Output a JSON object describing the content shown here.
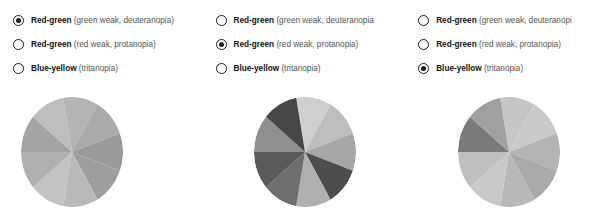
{
  "panels": [
    {
      "id": "deuteranopia-panel",
      "options": [
        {
          "name": "Red-green",
          "detail": "(green weak, deuteranopia)",
          "selected": true
        },
        {
          "name": "Red-green",
          "detail": "(red weak, protanopia)",
          "selected": false
        },
        {
          "name": "Blue-yellow",
          "detail": "(tritanopia)",
          "selected": false
        }
      ],
      "chart_name": "pie-chart-deuteranopia"
    },
    {
      "id": "protanopia-panel",
      "options": [
        {
          "name": "Red-green",
          "detail": "(green weak, deuteranopia",
          "selected": false
        },
        {
          "name": "Red-green",
          "detail": "(red weak, protanopia)",
          "selected": true
        },
        {
          "name": "Blue-yellow",
          "detail": "(tritanopia)",
          "selected": false
        }
      ],
      "chart_name": "pie-chart-protanopia"
    },
    {
      "id": "tritanopia-panel",
      "options": [
        {
          "name": "Red-green",
          "detail": "(green weak, deuteranopi",
          "selected": false
        },
        {
          "name": "Red-green",
          "detail": "(red weak, protanopia)",
          "selected": false
        },
        {
          "name": "Blue-yellow",
          "detail": "(tritanopia)",
          "selected": true
        }
      ],
      "chart_name": "pie-chart-tritanopia"
    }
  ],
  "chart_data": [
    {
      "type": "pie",
      "title": "Red-green (green weak, deuteranopia)",
      "categories": [
        "1",
        "2",
        "3",
        "4",
        "5",
        "6",
        "7",
        "8",
        "9"
      ],
      "values": [
        40,
        40,
        40,
        40,
        40,
        40,
        40,
        40,
        40
      ],
      "start_angle": -100,
      "colors": [
        "#b4b4b4",
        "#a9a9a9",
        "#9a9a9a",
        "#9e9e9e",
        "#b9b9b9",
        "#c3c3c3",
        "#b0b0b0",
        "#a4a4a4",
        "#bdbdbd"
      ],
      "legend": "none",
      "grid": false
    },
    {
      "type": "pie",
      "title": "Red-green (red weak, protanopia)",
      "categories": [
        "1",
        "2",
        "3",
        "4",
        "5",
        "6",
        "7",
        "8",
        "9"
      ],
      "values": [
        40,
        40,
        40,
        40,
        40,
        40,
        40,
        40,
        40
      ],
      "start_angle": -100,
      "colors": [
        "#cfcfcf",
        "#bdbdbd",
        "#a7a7a7",
        "#4d4d4d",
        "#b0b0b0",
        "#6e6e6e",
        "#5a5a5a",
        "#8f8f8f",
        "#474747"
      ],
      "legend": "none",
      "grid": false
    },
    {
      "type": "pie",
      "title": "Blue-yellow (tritanopia)",
      "categories": [
        "1",
        "2",
        "3",
        "4",
        "5",
        "6",
        "7",
        "8",
        "9"
      ],
      "values": [
        40,
        40,
        40,
        40,
        40,
        40,
        40,
        40,
        40
      ],
      "start_angle": -100,
      "colors": [
        "#c6c6c6",
        "#cacaca",
        "#b4b4b4",
        "#aaaaaa",
        "#b8b8b8",
        "#c9c9c9",
        "#bfbfbf",
        "#7a7a7a",
        "#a0a0a0"
      ],
      "legend": "none",
      "grid": false
    }
  ],
  "layout": {
    "pie_left_offsets": [
      21,
      51,
      53
    ],
    "pie_top": 11,
    "pie_width": 102,
    "pie_height": 110
  }
}
